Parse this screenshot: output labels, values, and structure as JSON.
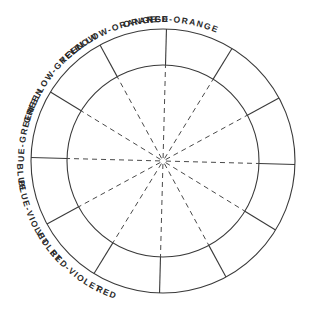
{
  "diagram": {
    "center": [
      163,
      161
    ],
    "outer_radius": 132,
    "inner_radius": 96,
    "label_radius_top": 139,
    "label_radius_bottom": 146,
    "rotation_deg": 1.5,
    "line_color": "#3a3a3a",
    "segments": [
      {
        "label": "YELLOW",
        "center_angle": 75
      },
      {
        "label": "YELLOW-ORANGE",
        "center_angle": 45
      },
      {
        "label": "ORANGE",
        "center_angle": 15
      },
      {
        "label": "RED-ORANGE",
        "center_angle": -15
      },
      {
        "label": "RED",
        "center_angle": -45
      },
      {
        "label": "RED-VIOLET",
        "center_angle": -75
      },
      {
        "label": "VIOLET",
        "center_angle": -105
      },
      {
        "label": "BLUE-VIOLET",
        "center_angle": -135
      },
      {
        "label": "BLUE",
        "center_angle": -165
      },
      {
        "label": "BLUE-GREEN",
        "center_angle": 165
      },
      {
        "label": "GREEN",
        "center_angle": 135
      },
      {
        "label": "YELLOW-GREEN",
        "center_angle": 105
      }
    ]
  }
}
